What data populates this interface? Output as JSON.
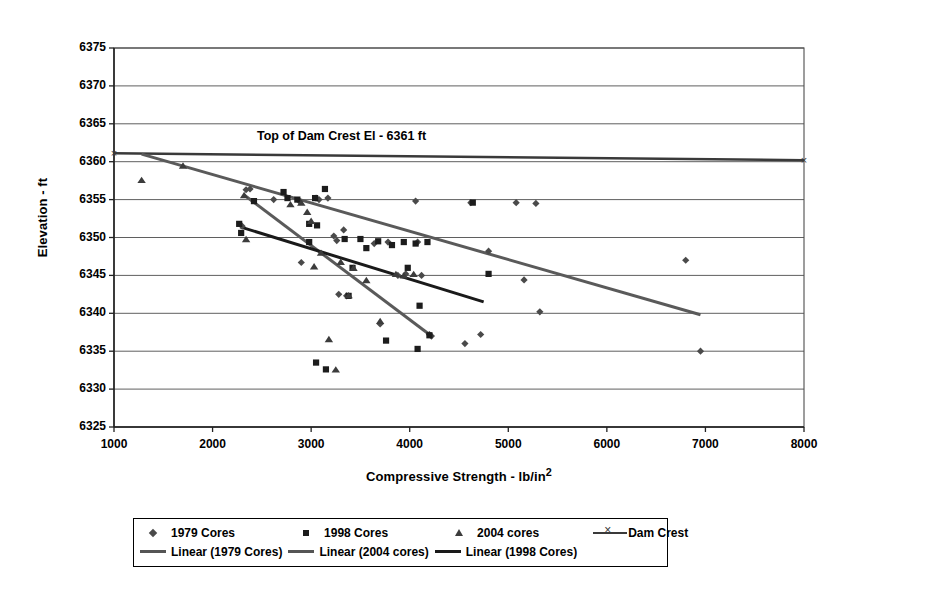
{
  "chart_data": {
    "type": "scatter",
    "title": "",
    "xlabel": "Compressive Strength - lb/in",
    "xlabel_sup": "2",
    "ylabel": "Elevation - ft",
    "xlim": [
      1000,
      8000
    ],
    "ylim": [
      6325,
      6375
    ],
    "xticks": [
      1000,
      2000,
      3000,
      4000,
      5000,
      6000,
      7000,
      8000
    ],
    "yticks": [
      6325,
      6330,
      6335,
      6340,
      6345,
      6350,
      6355,
      6360,
      6365,
      6370,
      6375
    ],
    "grid": "horizontal",
    "legend_position": "bottom",
    "annotations": [
      {
        "text": "Top of Dam Crest El - 6361 ft",
        "x": 2450,
        "y": 6363.2
      }
    ],
    "series": [
      {
        "name": "1979 Cores",
        "marker": "diamond",
        "color": "#4a4a4a",
        "points": [
          [
            2340,
            6356.3
          ],
          [
            2380,
            6356.4
          ],
          [
            2300,
            6351.5
          ],
          [
            2620,
            6355.0
          ],
          [
            2880,
            6354.8
          ],
          [
            2900,
            6346.7
          ],
          [
            3050,
            6355.2
          ],
          [
            3080,
            6355.0
          ],
          [
            3230,
            6350.2
          ],
          [
            3260,
            6349.6
          ],
          [
            3280,
            6342.5
          ],
          [
            3330,
            6351.0
          ],
          [
            3360,
            6342.3
          ],
          [
            3640,
            6349.2
          ],
          [
            3700,
            6338.6
          ],
          [
            3780,
            6349.4
          ],
          [
            3880,
            6345.0
          ],
          [
            3960,
            6345.2
          ],
          [
            4060,
            6354.8
          ],
          [
            4080,
            6349.4
          ],
          [
            4120,
            6345.0
          ],
          [
            4200,
            6337.2
          ],
          [
            4220,
            6337.0
          ],
          [
            4560,
            6336.0
          ],
          [
            4620,
            6354.6
          ],
          [
            4800,
            6348.2
          ],
          [
            5080,
            6354.6
          ],
          [
            5160,
            6344.4
          ],
          [
            5280,
            6354.5
          ],
          [
            5320,
            6340.2
          ],
          [
            4720,
            6337.2
          ],
          [
            6800,
            6347.0
          ],
          [
            6950,
            6335.0
          ],
          [
            3170,
            6355.2
          ]
        ]
      },
      {
        "name": "1998 Cores",
        "marker": "square",
        "color": "#1c1c1c",
        "points": [
          [
            2270,
            6351.8
          ],
          [
            2290,
            6350.6
          ],
          [
            2720,
            6356.0
          ],
          [
            2760,
            6355.2
          ],
          [
            2860,
            6355.0
          ],
          [
            2980,
            6351.8
          ],
          [
            3040,
            6355.2
          ],
          [
            3060,
            6351.6
          ],
          [
            3140,
            6356.4
          ],
          [
            3050,
            6333.5
          ],
          [
            3150,
            6332.6
          ],
          [
            3340,
            6349.8
          ],
          [
            3380,
            6342.3
          ],
          [
            3420,
            6346.0
          ],
          [
            3500,
            6349.8
          ],
          [
            3560,
            6348.6
          ],
          [
            3680,
            6349.5
          ],
          [
            3760,
            6336.4
          ],
          [
            3820,
            6349.0
          ],
          [
            3940,
            6349.4
          ],
          [
            3980,
            6346.0
          ],
          [
            4060,
            6349.2
          ],
          [
            4080,
            6335.3
          ],
          [
            4100,
            6341.0
          ],
          [
            4180,
            6349.4
          ],
          [
            4200,
            6337.1
          ],
          [
            4640,
            6354.6
          ],
          [
            4800,
            6345.2
          ],
          [
            2420,
            6354.8
          ],
          [
            2980,
            6349.4
          ]
        ]
      },
      {
        "name": "2004 cores",
        "marker": "triangle",
        "color": "#3c3c3c",
        "points": [
          [
            1280,
            6357.6
          ],
          [
            1700,
            6359.5
          ],
          [
            2320,
            6355.6
          ],
          [
            2340,
            6349.8
          ],
          [
            2790,
            6354.4
          ],
          [
            2900,
            6354.6
          ],
          [
            2960,
            6353.4
          ],
          [
            3000,
            6352.2
          ],
          [
            3030,
            6346.2
          ],
          [
            3100,
            6348.0
          ],
          [
            3180,
            6336.6
          ],
          [
            3250,
            6332.6
          ],
          [
            3300,
            6346.8
          ],
          [
            3380,
            6342.4
          ],
          [
            3430,
            6346.0
          ],
          [
            3560,
            6344.4
          ],
          [
            3700,
            6339.0
          ],
          [
            3860,
            6345.2
          ],
          [
            3940,
            6345.0
          ],
          [
            4040,
            6345.2
          ]
        ]
      }
    ],
    "lines": [
      {
        "name": "Dam Crest",
        "marker": "x-line",
        "color": "#3a3a3a",
        "width": 2.5,
        "points": [
          [
            1000,
            6361.1
          ],
          [
            8000,
            6360.2
          ]
        ]
      },
      {
        "name": "Linear (1979 Cores)",
        "color": "#5a5a5a",
        "width": 3,
        "points": [
          [
            1280,
            6361.0
          ],
          [
            6950,
            6339.8
          ]
        ]
      },
      {
        "name": "Linear (2004 cores)",
        "color": "#5a5a5a",
        "width": 3,
        "points": [
          [
            2320,
            6355.6
          ],
          [
            4200,
            6337.2
          ]
        ]
      },
      {
        "name": "Linear (1998 Cores)",
        "color": "#1a1a1a",
        "width": 3,
        "points": [
          [
            2280,
            6351.4
          ],
          [
            4750,
            6341.5
          ]
        ]
      }
    ]
  },
  "legend": {
    "row1": [
      {
        "label": "1979 Cores",
        "key": "diamond"
      },
      {
        "label": "1998 Cores",
        "key": "square"
      },
      {
        "label": "2004 cores",
        "key": "triangle"
      },
      {
        "label": "Dam Crest",
        "key": "damcrest"
      }
    ],
    "row2": [
      {
        "label": "Linear (1979 Cores)",
        "key": "line"
      },
      {
        "label": "Linear (2004 cores)",
        "key": "line"
      },
      {
        "label": "Linear (1998 Cores)",
        "key": "line-thick"
      }
    ]
  },
  "plot_geometry": {
    "left": 114,
    "right": 804,
    "top": 48,
    "bottom": 427
  }
}
